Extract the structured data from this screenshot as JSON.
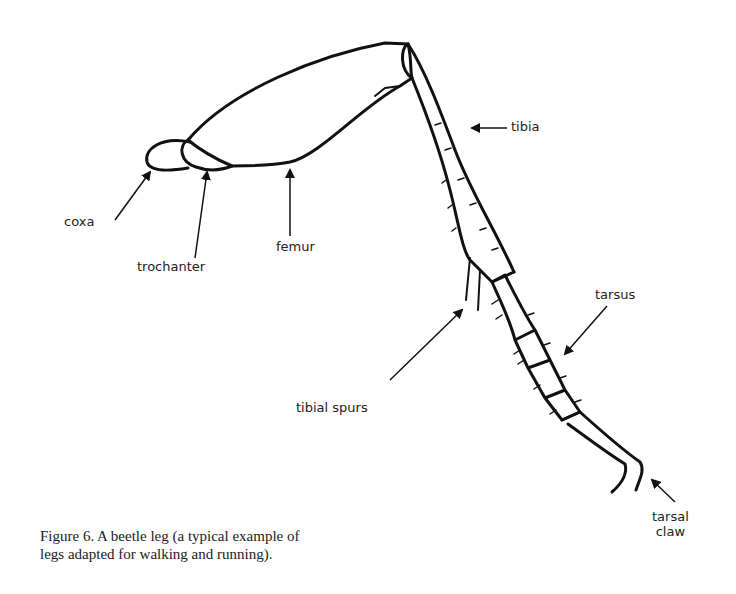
{
  "figure": {
    "caption_line1": "Figure 6. A beetle leg (a typical example of",
    "caption_line2": "legs adapted for walking and running).",
    "labels": {
      "coxa": "coxa",
      "trochanter": "trochanter",
      "femur": "femur",
      "tibia": "tibia",
      "tibial_spurs": "tibial spurs",
      "tarsus": "tarsus",
      "tarsal_claw_line1": "tarsal",
      "tarsal_claw_line2": "claw"
    },
    "colors": {
      "ink": "#111111",
      "background": "#ffffff"
    }
  }
}
